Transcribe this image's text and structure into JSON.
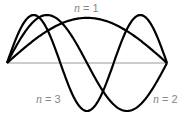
{
  "diagram": {
    "baseline": {
      "x0": 7,
      "x1": 167,
      "y": 63
    },
    "amplitude": 48,
    "stroke_color": "#000000",
    "baseline_color": "#999999",
    "label_color": "#888888",
    "modes": [
      {
        "n": 1,
        "label_var": "n",
        "label_eq": " = 1",
        "phase": 1,
        "amp_scale": 0.94,
        "label_pos": {
          "x": 74,
          "y": 2
        }
      },
      {
        "n": 2,
        "label_var": "n",
        "label_eq": " = 2",
        "phase": 1,
        "amp_scale": 1.0,
        "label_pos": {
          "x": 153,
          "y": 93
        }
      },
      {
        "n": 3,
        "label_var": "n",
        "label_eq": " = 3",
        "phase": 1,
        "amp_scale": 1.0,
        "label_pos": {
          "x": 36,
          "y": 93
        }
      }
    ]
  }
}
